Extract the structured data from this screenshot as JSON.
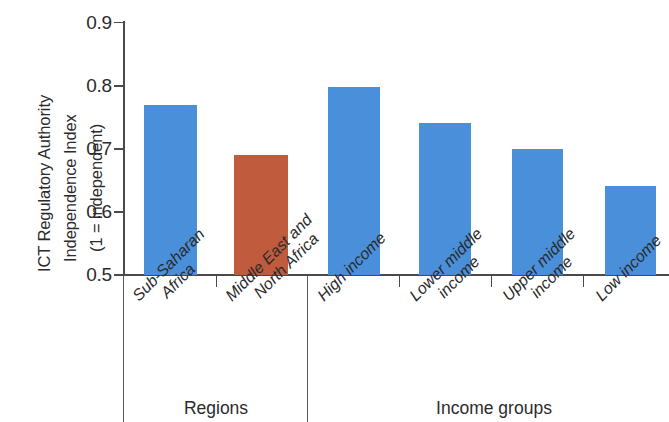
{
  "chart_data": {
    "type": "bar",
    "title": "",
    "subtitle": "",
    "xlabel": "",
    "ylabel": "ICT Regulatory Authority Independence Index (1 = independent)",
    "ylabel_lines": [
      "ICT Regulatory Authority",
      "Independence Index",
      "(1 = independent)"
    ],
    "ylim": [
      0.5,
      0.9
    ],
    "ytick_labels": [
      "0.9",
      "0.8",
      "0.7",
      "0.6",
      "0.5"
    ],
    "ytick_values": [
      0.9,
      0.8,
      0.7,
      0.6,
      0.5
    ],
    "grid": false,
    "legend": "none",
    "categories": [
      "Sub-Saharan Africa",
      "Middle East and North Africa",
      "High income",
      "Lower middle income",
      "Upper middle income",
      "Low income"
    ],
    "values": [
      0.77,
      0.69,
      0.798,
      0.741,
      0.7,
      0.642
    ],
    "colors": [
      "#4a8fd9",
      "#c15b3d",
      "#4a8fd9",
      "#4a8fd9",
      "#4a8fd9",
      "#4a8fd9"
    ],
    "groups": [
      {
        "label": "Regions",
        "categories": [
          "Sub-Saharan Africa",
          "Middle East and North Africa"
        ]
      },
      {
        "label": "Income groups",
        "categories": [
          "High income",
          "Lower middle income",
          "Upper middle income",
          "Low income"
        ]
      }
    ]
  },
  "axis": {
    "ticks": [
      {
        "label": "0.9",
        "value": 0.9
      },
      {
        "label": "0.8",
        "value": 0.8
      },
      {
        "label": "0.7",
        "value": 0.7
      },
      {
        "label": "0.6",
        "value": 0.6
      },
      {
        "label": "0.5",
        "value": 0.5
      }
    ]
  },
  "ylabel_lines": {
    "line1": "ICT Regulatory Authority",
    "line2": "Independence Index",
    "line3": "(1 = independent)"
  },
  "bars": [
    {
      "line1": "Sub-Saharan",
      "line2": "Africa",
      "value": 0.77,
      "color": "#4a8fd9"
    },
    {
      "line1": "Middle East and",
      "line2": "North Africa",
      "value": 0.69,
      "color": "#c15b3d"
    },
    {
      "line1": "High income",
      "line2": "",
      "value": 0.798,
      "color": "#4a8fd9"
    },
    {
      "line1": "Lower middle",
      "line2": "income",
      "value": 0.741,
      "color": "#4a8fd9"
    },
    {
      "line1": "Upper middle",
      "line2": "income",
      "value": 0.7,
      "color": "#4a8fd9"
    },
    {
      "line1": "Low income",
      "line2": "",
      "value": 0.642,
      "color": "#4a8fd9"
    }
  ],
  "groups": {
    "regions": "Regions",
    "income": "Income groups"
  },
  "colors": {
    "bar_blue": "#4a8fd9",
    "bar_orange": "#c15b3d",
    "axis": "#4a4a4a",
    "text": "#2b2b2b",
    "background": "#ffffff"
  }
}
